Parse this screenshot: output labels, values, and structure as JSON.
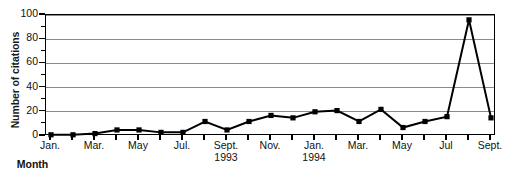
{
  "chart_data": {
    "type": "line",
    "title": "",
    "xlabel": "Month",
    "ylabel": "Number of citations",
    "ylim": [
      0,
      100
    ],
    "ytick_values": [
      0,
      20,
      40,
      60,
      80,
      100
    ],
    "ytick_labels": [
      "0",
      "20",
      "40",
      "60",
      "80",
      "100"
    ],
    "yminor_values": [
      10,
      30,
      50,
      70,
      90
    ],
    "grid": "horizontal",
    "legend": "none",
    "marker": "square",
    "line_color": "#000000",
    "marker_color": "#000000",
    "grid_color": "#8a8a8a",
    "x": [
      "Jan. 1993",
      "Feb. 1993",
      "Mar. 1993",
      "Apr. 1993",
      "May 1993",
      "Jun. 1993",
      "Jul. 1993",
      "Aug. 1993",
      "Sept. 1993",
      "Oct. 1993",
      "Nov. 1993",
      "Dec. 1993",
      "Jan. 1994",
      "Feb. 1994",
      "Mar. 1994",
      "Apr. 1994",
      "May 1994",
      "Jun. 1994",
      "Jul. 1994",
      "Aug. 1994",
      "Sept. 1994"
    ],
    "values": [
      1,
      1,
      2,
      5,
      5,
      3,
      3,
      12,
      5,
      12,
      17,
      15,
      20,
      21,
      12,
      22,
      7,
      12,
      16,
      96,
      15
    ],
    "xtick_labels": [
      {
        "index": 0,
        "label": "Jan.",
        "year": ""
      },
      {
        "index": 2,
        "label": "Mar.",
        "year": ""
      },
      {
        "index": 4,
        "label": "May",
        "year": ""
      },
      {
        "index": 6,
        "label": "Jul.",
        "year": ""
      },
      {
        "index": 8,
        "label": "Sept.",
        "year": "1993"
      },
      {
        "index": 10,
        "label": "Nov.",
        "year": ""
      },
      {
        "index": 12,
        "label": "Jan.",
        "year": "1994"
      },
      {
        "index": 14,
        "label": "Mar.",
        "year": ""
      },
      {
        "index": 16,
        "label": "May",
        "year": ""
      },
      {
        "index": 18,
        "label": "Jul",
        "year": ""
      },
      {
        "index": 20,
        "label": "Sept.",
        "year": ""
      }
    ],
    "annotations": []
  }
}
